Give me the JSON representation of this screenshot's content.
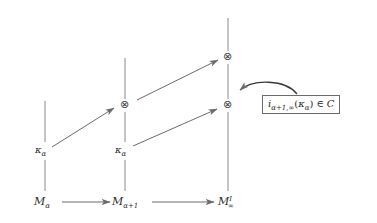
{
  "diagram": {
    "kind": "commutative-diagram",
    "background_color": "#ffffff",
    "line_color": "#6b6b6b",
    "text_color": "#2b2b2b",
    "bottom_row": {
      "nodes": [
        {
          "id": "m-alpha",
          "label_main": "M",
          "label_sub": "α",
          "label_sup": ""
        },
        {
          "id": "m-alpha-plus-1",
          "label_main": "M",
          "label_sub": "α+1",
          "label_sup": ""
        },
        {
          "id": "m-infinity-I",
          "label_main": "M",
          "label_sub": "∞",
          "label_sup": "I"
        }
      ]
    },
    "kappa_labels": [
      {
        "id": "kappa-left",
        "label_main": "κ",
        "label_sub": "α"
      },
      {
        "id": "kappa-middle",
        "label_main": "κ",
        "label_sub": "α"
      }
    ],
    "tensor_nodes": [
      {
        "id": "otimes-middle",
        "glyph": "⊗"
      },
      {
        "id": "otimes-right-lower",
        "glyph": "⊗"
      },
      {
        "id": "otimes-right-upper",
        "glyph": "⊗"
      }
    ],
    "callout": {
      "text_parts": {
        "i": "i",
        "sub": "α+1,∞",
        "open": "(",
        "kappa": "κ",
        "kappa_sub": "α",
        "close": ")",
        "member": "∈",
        "set": "C"
      },
      "full_text": "i_{α+1,∞}(κ_α) ∈ C"
    }
  }
}
